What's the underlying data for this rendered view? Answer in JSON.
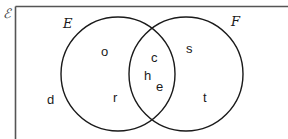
{
  "diagram": {
    "type": "venn",
    "universal_set_symbol": "ℰ",
    "sets": [
      {
        "name": "E",
        "label": "E"
      },
      {
        "name": "F",
        "label": "F"
      }
    ],
    "regions": {
      "E_only": [
        "o",
        "r"
      ],
      "E_and_F": [
        "c",
        "h",
        "e"
      ],
      "F_only": [
        "s",
        "t"
      ],
      "outside": [
        "d"
      ]
    },
    "elements": {
      "o": "o",
      "r": "r",
      "c": "c",
      "h": "h",
      "e": "e",
      "s": "s",
      "t": "t",
      "d": "d"
    },
    "colors": {
      "stroke": "#1a1a1a",
      "frame": "#555555",
      "background": "#ffffff"
    }
  }
}
